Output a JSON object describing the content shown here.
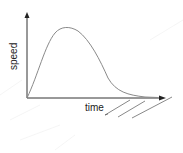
{
  "diagram": {
    "type": "speed-time sketch",
    "y_axis_label": "speed",
    "x_axis_label": "time",
    "curve": {
      "description": "speed rises from zero to a peak then decays back toward zero",
      "color": "#8a8a8a"
    },
    "axis_color": "#333333",
    "annotations": "three hand-drawn diagonal strokes below the x-axis near the right"
  }
}
